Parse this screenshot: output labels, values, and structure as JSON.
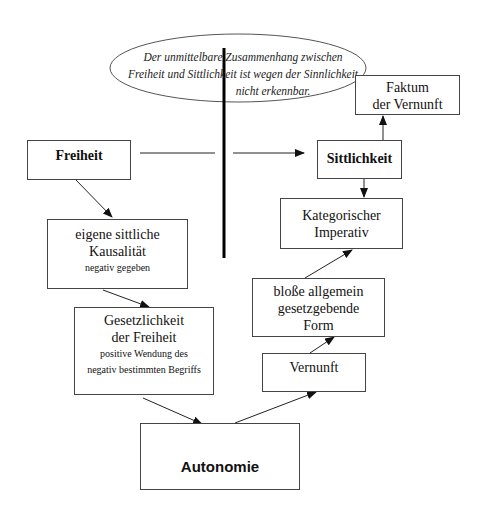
{
  "ellipse": {
    "lines": [
      "Der unmittelbare Zusammenhang zwischen",
      "Freiheit und Sittlichkeit ist wegen der Sinnlichkeit",
      "nicht erkennbar."
    ]
  },
  "nodes": {
    "faktum": {
      "lines": [
        "Faktum",
        "der Vernunft"
      ]
    },
    "freiheit": {
      "label": "Freiheit"
    },
    "sittlichkeit": {
      "label": "Sittlichkeit"
    },
    "kausalitaet": {
      "lines": [
        "eigene sittliche",
        "Kausalität"
      ],
      "note": "negativ gegeben"
    },
    "kategorisch": {
      "lines": [
        "Kategorischer",
        "Imperativ"
      ]
    },
    "form": {
      "lines": [
        "bloße allgemein",
        "gesetzgebende",
        "Form"
      ]
    },
    "gesetzlichkeit": {
      "lines": [
        "Gesetzlichkeit",
        "der Freiheit"
      ],
      "notes": [
        "positive Wendung des",
        "negativ bestimmten Begriffs"
      ]
    },
    "vernunft": {
      "label": "Vernunft"
    },
    "autonomie": {
      "label": "Autonomie"
    }
  },
  "colors": {
    "line": "#222222",
    "border": "#444444",
    "background": "#ffffff"
  }
}
